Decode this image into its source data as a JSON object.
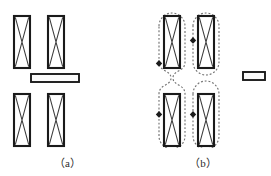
{
  "figure": {
    "background_color": "#ffffff",
    "width": 271,
    "height": 176
  },
  "colors": {
    "coil_outline": "#1a1a1a",
    "coil_fill": "#ffffff",
    "coil_cross": "#3a3a3a",
    "bar_outline": "#1a1a1a",
    "bar_fill": "#fbfbfb",
    "flux_line": "#737373",
    "flux_arrow": "#1c1c1c",
    "caption_text": "#2b2b2b"
  },
  "panels": [
    {
      "id": "a",
      "caption": "（a）",
      "caption_plain": "(a)",
      "description": "Four coil windings in a 2x2 arrangement with a horizontal bar between the upper and lower coil rows; no flux path shown.",
      "coils": [
        {
          "name": "coil-top-left",
          "x": 14,
          "y": 16,
          "width": 16,
          "height": 52,
          "marking": "cross"
        },
        {
          "name": "coil-top-right",
          "x": 48,
          "y": 16,
          "width": 16,
          "height": 52,
          "marking": "cross"
        },
        {
          "name": "coil-bottom-left",
          "x": 14,
          "y": 94,
          "width": 16,
          "height": 52,
          "marking": "cross"
        },
        {
          "name": "coil-bottom-right",
          "x": 48,
          "y": 94,
          "width": 16,
          "height": 52,
          "marking": "cross"
        }
      ],
      "bar": {
        "name": "mover-bar",
        "x": 31,
        "y": 74,
        "width": 48,
        "height": 8
      },
      "flux_paths": []
    },
    {
      "id": "b",
      "caption": "（b）",
      "caption_plain": "(b)",
      "description": "Same four coil windings, each enclosed by a dashed rounded magnetic-flux contour with direction arrowheads; the bar is displaced to the right, and the left-hand flux contour is pinched at the mid-plane.",
      "coils": [
        {
          "name": "coil-top-left",
          "x": 29,
          "y": 16,
          "width": 16,
          "height": 52,
          "marking": "cross"
        },
        {
          "name": "coil-top-right",
          "x": 63,
          "y": 16,
          "width": 16,
          "height": 52,
          "marking": "cross"
        },
        {
          "name": "coil-bottom-left",
          "x": 29,
          "y": 94,
          "width": 16,
          "height": 52,
          "marking": "cross"
        },
        {
          "name": "coil-bottom-right",
          "x": 63,
          "y": 94,
          "width": 16,
          "height": 52,
          "marking": "cross"
        }
      ],
      "bar": {
        "name": "mover-bar",
        "x": 108,
        "y": 72,
        "width": 22,
        "height": 8
      },
      "flux_paths": [
        {
          "name": "flux-contour-left",
          "style": "dashed",
          "shape": "pinched-capsule"
        },
        {
          "name": "flux-contour-right",
          "style": "dashed",
          "shape": "capsule"
        }
      ],
      "flux_arrows": [
        {
          "name": "flux-arrow-upper-left",
          "x": 24,
          "y": 63
        },
        {
          "name": "flux-arrow-upper-right",
          "x": 58,
          "y": 40
        },
        {
          "name": "flux-arrow-lower-left",
          "x": 24,
          "y": 114
        },
        {
          "name": "flux-arrow-lower-right",
          "x": 58,
          "y": 114
        }
      ]
    }
  ]
}
